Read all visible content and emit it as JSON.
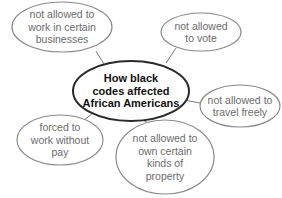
{
  "diagram": {
    "type": "concept-map",
    "colors": {
      "center_stroke": "#2a2a2a",
      "leaf_stroke": "#8a8a8a",
      "connector": "#7a7a7a",
      "leaf_text": "#6b6b6b",
      "center_text": "#111111",
      "background": "#ffffff"
    },
    "center": {
      "line1": "How black",
      "line2": "codes affected",
      "line3": "African Americans"
    },
    "nodes": [
      {
        "id": "work-businesses",
        "line1": "not allowed to",
        "line2": "work in certain",
        "line3": "businesses"
      },
      {
        "id": "vote",
        "line1": "not allowed",
        "line2": "to vote"
      },
      {
        "id": "travel",
        "line1": "not allowed to",
        "line2": "travel freely"
      },
      {
        "id": "forced-work",
        "line1": "forced to",
        "line2": "work without",
        "line3": "pay"
      },
      {
        "id": "property",
        "line1": "not allowed to",
        "line2": "own certain",
        "line3": "kinds of",
        "line4": "property"
      }
    ]
  }
}
